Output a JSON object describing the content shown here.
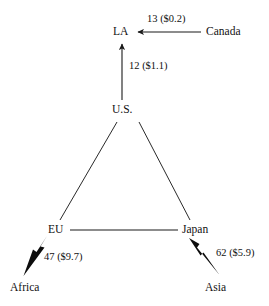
{
  "diagram": {
    "type": "trade-flow-network",
    "nodes": [
      {
        "id": "la",
        "label": "LA",
        "x": 113,
        "y": 26
      },
      {
        "id": "canada",
        "label": "Canada",
        "x": 206,
        "y": 26
      },
      {
        "id": "us",
        "label": "U.S.",
        "x": 112,
        "y": 104
      },
      {
        "id": "eu",
        "label": "EU",
        "x": 48,
        "y": 224
      },
      {
        "id": "japan",
        "label": "Japan",
        "x": 182,
        "y": 224
      },
      {
        "id": "africa",
        "label": "Africa",
        "x": 10,
        "y": 282
      },
      {
        "id": "asia",
        "label": "Asia",
        "x": 205,
        "y": 282
      }
    ],
    "edges": [
      {
        "id": "canada-to-la",
        "from": "canada",
        "to": "la",
        "label": "13 ($0.2)",
        "label_x": 147,
        "label_y": 14,
        "arrow": "thin",
        "direction": "left"
      },
      {
        "id": "us-to-la",
        "from": "us",
        "to": "la",
        "label": "12 ($1.1)",
        "label_x": 129,
        "label_y": 61,
        "arrow": "thin",
        "direction": "up"
      },
      {
        "id": "us-to-eu",
        "from": "us",
        "to": "eu",
        "label": "",
        "arrow": "none",
        "direction": "none"
      },
      {
        "id": "us-to-japan",
        "from": "us",
        "to": "japan",
        "label": "",
        "arrow": "none",
        "direction": "none"
      },
      {
        "id": "eu-to-japan",
        "from": "eu",
        "to": "japan",
        "label": "",
        "arrow": "none",
        "direction": "none"
      },
      {
        "id": "eu-to-africa",
        "from": "eu",
        "to": "africa",
        "label": "47 ($9.7)",
        "label_x": 44,
        "label_y": 252,
        "arrow": "thick",
        "direction": "down-left"
      },
      {
        "id": "japan-to-asia",
        "from": "japan",
        "to": "asia",
        "label": "62 ($5.9)",
        "label_x": 216,
        "label_y": 248,
        "arrow": "thick",
        "direction": "down-right"
      }
    ],
    "colors": {
      "line": "#1a1a1a",
      "text": "#111111",
      "background": "#ffffff"
    }
  }
}
